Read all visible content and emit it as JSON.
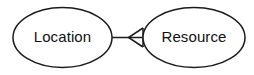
{
  "diagram": {
    "type": "entity-relationship",
    "background_color": "#ffffff",
    "stroke_color": "#1b1b1b",
    "text_color": "#111111",
    "nodes": [
      {
        "id": "location",
        "label": "Location",
        "shape": "ellipse",
        "cx": 62.5,
        "cy": 37.5,
        "rx": 49.5,
        "ry": 30
      },
      {
        "id": "resource",
        "label": "Resource",
        "shape": "ellipse",
        "cx": 194,
        "cy": 37.5,
        "rx": 51,
        "ry": 30
      }
    ],
    "connectors": [
      {
        "id": "location-resource-link",
        "from": "location",
        "to": "resource",
        "style": "solid",
        "endpoint_marker": "open-triangle-arrow",
        "marker_direction": "left",
        "line_x1": 112,
        "line_x2": 143,
        "line_y": 37.5,
        "arrow_points": "143,28 128.5,37.5 143,47"
      }
    ]
  }
}
